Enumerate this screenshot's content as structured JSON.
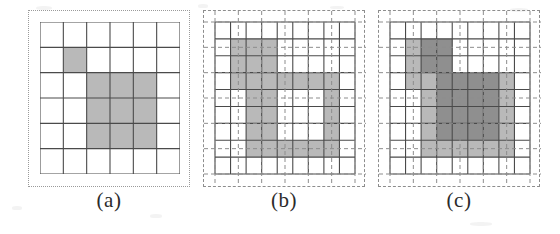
{
  "figure": {
    "background_color": "#ffffff",
    "width": 560,
    "height": 234
  },
  "colors": {
    "grid_line": "#4a4a4a",
    "dashed_line": "#8d8d8d",
    "dotted_frame": "#9a9a9a",
    "shade_light": "#b9b9b9",
    "shade_dark": "#8f8f8f",
    "cell_empty": "#ffffff",
    "caption_text": "#2b2b2b"
  },
  "panels": [
    {
      "id": "panel-a",
      "caption": "(a)",
      "frame_style": "dotted",
      "grid": {
        "cols": 6,
        "rows": 6,
        "line_style": "solid"
      },
      "overlay_grid": null,
      "shaded_cells_light": [
        [
          1,
          1
        ],
        [
          2,
          2
        ],
        [
          3,
          2
        ],
        [
          4,
          2
        ],
        [
          2,
          3
        ],
        [
          3,
          3
        ],
        [
          4,
          3
        ],
        [
          2,
          4
        ],
        [
          3,
          4
        ],
        [
          4,
          4
        ]
      ],
      "shaded_cells_dark": []
    },
    {
      "id": "panel-b",
      "caption": "(b)",
      "frame_style": "dashed",
      "grid": {
        "cols": 9,
        "rows": 9,
        "line_style": "solid"
      },
      "overlay_grid": {
        "cols": 6,
        "rows": 6,
        "line_style": "dashed"
      },
      "shaded_cells_light": [
        [
          1,
          1
        ],
        [
          2,
          1
        ],
        [
          3,
          1
        ],
        [
          1,
          2
        ],
        [
          2,
          2
        ],
        [
          3,
          2
        ],
        [
          1,
          3
        ],
        [
          2,
          3
        ],
        [
          3,
          3
        ],
        [
          4,
          3
        ],
        [
          5,
          3
        ],
        [
          6,
          3
        ],
        [
          7,
          3
        ],
        [
          2,
          4
        ],
        [
          3,
          4
        ],
        [
          7,
          4
        ],
        [
          2,
          5
        ],
        [
          3,
          5
        ],
        [
          7,
          5
        ],
        [
          2,
          6
        ],
        [
          3,
          6
        ],
        [
          7,
          6
        ],
        [
          2,
          7
        ],
        [
          3,
          7
        ],
        [
          4,
          7
        ],
        [
          5,
          7
        ],
        [
          6,
          7
        ],
        [
          7,
          7
        ]
      ],
      "shaded_cells_dark": []
    },
    {
      "id": "panel-c",
      "caption": "(c)",
      "frame_style": "dashed",
      "grid": {
        "cols": 9,
        "rows": 9,
        "line_style": "solid"
      },
      "overlay_grid": {
        "cols": 6,
        "rows": 6,
        "line_style": "dashed"
      },
      "shaded_cells_light": [
        [
          1,
          1
        ],
        [
          2,
          1
        ],
        [
          3,
          1
        ],
        [
          1,
          2
        ],
        [
          2,
          2
        ],
        [
          3,
          2
        ],
        [
          1,
          3
        ],
        [
          2,
          3
        ],
        [
          3,
          3
        ],
        [
          4,
          3
        ],
        [
          5,
          3
        ],
        [
          6,
          3
        ],
        [
          7,
          3
        ],
        [
          2,
          4
        ],
        [
          3,
          4
        ],
        [
          4,
          4
        ],
        [
          5,
          4
        ],
        [
          6,
          4
        ],
        [
          7,
          4
        ],
        [
          2,
          5
        ],
        [
          3,
          5
        ],
        [
          4,
          5
        ],
        [
          5,
          5
        ],
        [
          6,
          5
        ],
        [
          7,
          5
        ],
        [
          2,
          6
        ],
        [
          3,
          6
        ],
        [
          4,
          6
        ],
        [
          5,
          6
        ],
        [
          6,
          6
        ],
        [
          7,
          6
        ],
        [
          2,
          7
        ],
        [
          3,
          7
        ],
        [
          4,
          7
        ],
        [
          5,
          7
        ],
        [
          6,
          7
        ],
        [
          7,
          7
        ]
      ],
      "shaded_cells_dark": [
        [
          2,
          1
        ],
        [
          3,
          1
        ],
        [
          2,
          2
        ],
        [
          3,
          2
        ],
        [
          3,
          3
        ],
        [
          4,
          3
        ],
        [
          5,
          3
        ],
        [
          6,
          3
        ],
        [
          3,
          4
        ],
        [
          4,
          4
        ],
        [
          5,
          4
        ],
        [
          6,
          4
        ],
        [
          3,
          5
        ],
        [
          4,
          5
        ],
        [
          5,
          5
        ],
        [
          6,
          5
        ],
        [
          3,
          6
        ],
        [
          4,
          6
        ],
        [
          5,
          6
        ],
        [
          6,
          6
        ]
      ]
    }
  ],
  "layout": {
    "panel_a_left": 28,
    "panel_b_left": 203,
    "panel_c_left": 378,
    "panel_top": 10,
    "frame_size": 162,
    "inner_offset": 12,
    "inner_size": 138,
    "caption_a_left": 45,
    "caption_b_left": 220,
    "caption_c_left": 395
  }
}
